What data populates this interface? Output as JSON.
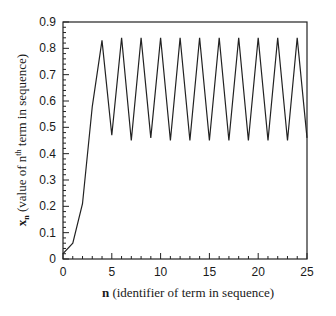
{
  "chart_data": {
    "type": "line",
    "title": "",
    "xlabel_bold": "n",
    "xlabel_rest": " (identifier of term in sequence)",
    "ylabel_bold": "x",
    "ylabel_sub": "n",
    "ylabel_rest_1": " (value of n",
    "ylabel_sup": "th",
    "ylabel_rest_2": " term in sequence)",
    "xlim": [
      0,
      25
    ],
    "ylim": [
      0,
      0.9
    ],
    "xticks": [
      "0",
      "5",
      "10",
      "15",
      "20",
      "25"
    ],
    "yticks": [
      "0",
      "0.1",
      "0.2",
      "0.3",
      "0.4",
      "0.5",
      "0.6",
      "0.7",
      "0.8",
      "0.9"
    ],
    "grid": false,
    "legend": null,
    "series": [
      {
        "name": "x_n",
        "x": [
          0,
          1,
          2,
          3,
          4,
          5,
          6,
          7,
          8,
          9,
          10,
          11,
          12,
          13,
          14,
          15,
          16,
          17,
          18,
          19,
          20,
          21,
          22,
          23,
          24,
          25
        ],
        "values": [
          0.02,
          0.06,
          0.21,
          0.58,
          0.83,
          0.47,
          0.84,
          0.45,
          0.84,
          0.46,
          0.84,
          0.45,
          0.84,
          0.45,
          0.84,
          0.45,
          0.84,
          0.45,
          0.84,
          0.45,
          0.84,
          0.45,
          0.84,
          0.45,
          0.84,
          0.46
        ]
      }
    ]
  }
}
